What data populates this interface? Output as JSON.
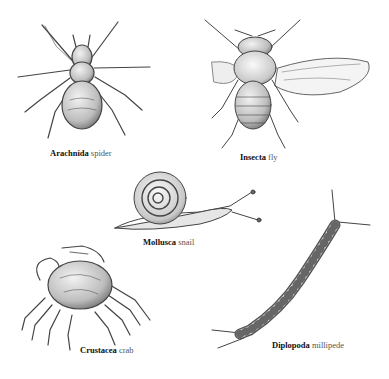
{
  "figure": {
    "background": "#ffffff",
    "ink_color": "#333333",
    "specimens": [
      {
        "id": "spider",
        "class_name": "Arachnida",
        "common_name": "spider"
      },
      {
        "id": "fly",
        "class_name": "Insecta",
        "common_name": "fly"
      },
      {
        "id": "snail",
        "class_name": "Mollusca",
        "common_name": "snail"
      },
      {
        "id": "crab",
        "class_name": "Crustacea",
        "common_name": "crab"
      },
      {
        "id": "millipede",
        "class_name": "Diplopoda",
        "common_name": "millipede"
      }
    ]
  }
}
